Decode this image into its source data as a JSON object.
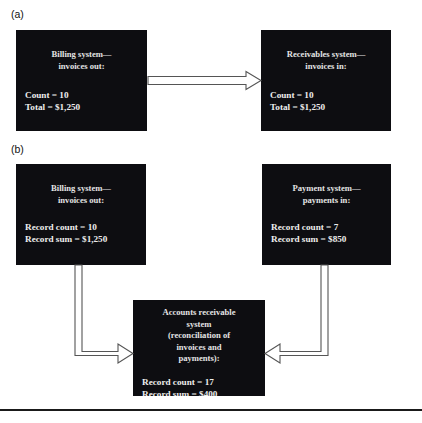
{
  "figure": {
    "panels": [
      {
        "label": "(a)",
        "nodes": [
          {
            "name": "billing-system-node",
            "title_lines": [
              "Billing system—",
              "invoices out:"
            ],
            "stats": [
              "Count = 10",
              "Total = $1,250"
            ]
          },
          {
            "name": "receivables-system-node",
            "title_lines": [
              "Receivables system—",
              "invoices in:"
            ],
            "stats": [
              "Count = 10",
              "Total = $1,250"
            ]
          }
        ],
        "connectors": [
          {
            "name": "billing-to-receivables-arrow",
            "style": "hollow-block-arrow",
            "direction": "right"
          }
        ]
      },
      {
        "label": "(b)",
        "nodes": [
          {
            "name": "billing-system-node",
            "title_lines": [
              "Billing system—",
              "invoices out:"
            ],
            "stats": [
              "Record count = 10",
              "Record sum = $1,250"
            ]
          },
          {
            "name": "payment-system-node",
            "title_lines": [
              "Payment system—",
              "payments in:"
            ],
            "stats": [
              "Record count = 7",
              "Record sum = $850"
            ]
          },
          {
            "name": "accounts-receivable-node",
            "title_lines": [
              "Accounts receivable",
              "system",
              "(reconciliation of",
              "invoices and",
              "payments):"
            ],
            "stats": [
              "Record count = 17",
              "Record sum = $400"
            ]
          }
        ],
        "connectors": [
          {
            "name": "billing-to-ar-arrow",
            "style": "hollow-block-arrow",
            "direction": "right"
          },
          {
            "name": "payment-to-ar-arrow",
            "style": "hollow-block-arrow",
            "direction": "left"
          }
        ]
      }
    ],
    "colors": {
      "node_fill": "#0d0d11",
      "node_text": "#e8e8e8",
      "connector_stroke": "#4a4a4a",
      "rule": "#1a1a1a",
      "background": "#ffffff"
    }
  }
}
